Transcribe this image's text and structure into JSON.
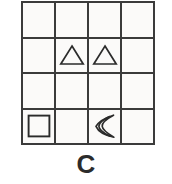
{
  "figure": {
    "label": "C",
    "grid": {
      "rows": 4,
      "cols": 4,
      "line_color": "#3b3b3b",
      "cell_fill": "#fbfaf9"
    },
    "cells": [
      {
        "row": 1,
        "col": 1,
        "shape": "empty",
        "shape_label": ""
      },
      {
        "row": 1,
        "col": 2,
        "shape": "empty",
        "shape_label": ""
      },
      {
        "row": 1,
        "col": 3,
        "shape": "empty",
        "shape_label": ""
      },
      {
        "row": 1,
        "col": 4,
        "shape": "empty",
        "shape_label": ""
      },
      {
        "row": 2,
        "col": 1,
        "shape": "empty",
        "shape_label": ""
      },
      {
        "row": 2,
        "col": 2,
        "shape": "triangle",
        "shape_label": "triangle"
      },
      {
        "row": 2,
        "col": 3,
        "shape": "triangle",
        "shape_label": "triangle"
      },
      {
        "row": 2,
        "col": 4,
        "shape": "empty",
        "shape_label": ""
      },
      {
        "row": 3,
        "col": 1,
        "shape": "empty",
        "shape_label": ""
      },
      {
        "row": 3,
        "col": 2,
        "shape": "empty",
        "shape_label": ""
      },
      {
        "row": 3,
        "col": 3,
        "shape": "empty",
        "shape_label": ""
      },
      {
        "row": 3,
        "col": 4,
        "shape": "empty",
        "shape_label": ""
      },
      {
        "row": 4,
        "col": 1,
        "shape": "square",
        "shape_label": "square"
      },
      {
        "row": 4,
        "col": 2,
        "shape": "empty",
        "shape_label": ""
      },
      {
        "row": 4,
        "col": 3,
        "shape": "crescent",
        "shape_label": "crescent-moon"
      },
      {
        "row": 4,
        "col": 4,
        "shape": "empty",
        "shape_label": ""
      }
    ],
    "colors": {
      "stroke": "#2b2b2b",
      "background": "#ffffff",
      "grid_line": "#3b3b3b"
    }
  }
}
